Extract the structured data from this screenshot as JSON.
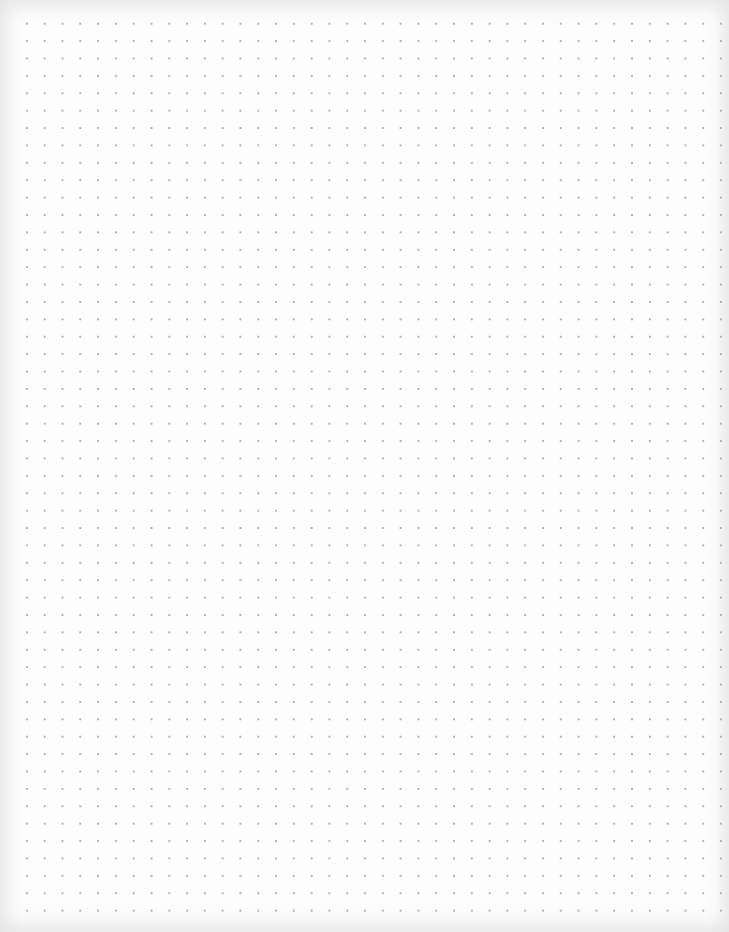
{
  "page": {
    "type": "dot-grid-paper",
    "background_color": "#ffffff",
    "dot_color": "#b4b4b4",
    "grid": {
      "columns": 40,
      "rows": 52,
      "spacing_x_px": 17.8,
      "spacing_y_px": 17.4,
      "first_dot": [
        27,
        24
      ]
    }
  }
}
